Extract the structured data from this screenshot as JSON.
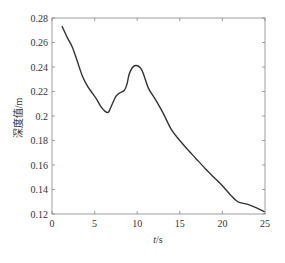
{
  "chart_data": {
    "type": "line",
    "title": "",
    "xlabel": "t/s",
    "xlabel_italic_part": "t",
    "xlabel_rest": "/s",
    "ylabel": "深度值/m",
    "xlim": [
      0,
      25
    ],
    "ylim": [
      0.12,
      0.28
    ],
    "xticks": [
      0,
      5,
      10,
      15,
      20,
      25
    ],
    "xtick_labels": [
      "0",
      "5",
      "10",
      "15",
      "20",
      "25"
    ],
    "yticks": [
      0.12,
      0.14,
      0.16,
      0.18,
      0.2,
      0.22,
      0.24,
      0.26,
      0.28
    ],
    "ytick_labels": [
      "0.12",
      "0.14",
      "0.16",
      "0.18",
      "0.2",
      "0.22",
      "0.24",
      "0.26",
      "0.28"
    ],
    "grid": false,
    "legend": null,
    "series": [
      {
        "name": "深度值",
        "color": "#333333",
        "x": [
          1.2,
          1.8,
          2.4,
          3.0,
          3.6,
          4.2,
          4.8,
          5.3,
          5.7,
          6.2,
          6.6,
          6.9,
          7.5,
          8.0,
          8.5,
          8.8,
          9.1,
          9.7,
          10.5,
          11.3,
          12.1,
          13.0,
          14.0,
          15.0,
          16.0,
          16.8,
          18.0,
          19.0,
          20.0,
          20.9,
          21.8,
          22.9,
          24.0,
          24.9
        ],
        "y": [
          0.273,
          0.264,
          0.256,
          0.244,
          0.232,
          0.224,
          0.218,
          0.213,
          0.208,
          0.204,
          0.203,
          0.207,
          0.216,
          0.219,
          0.221,
          0.226,
          0.235,
          0.241,
          0.238,
          0.223,
          0.214,
          0.203,
          0.189,
          0.18,
          0.172,
          0.166,
          0.157,
          0.15,
          0.143,
          0.136,
          0.13,
          0.128,
          0.125,
          0.122
        ]
      }
    ]
  },
  "colors": {
    "line": "#333333",
    "axes": "#888888",
    "text": "#333333"
  }
}
